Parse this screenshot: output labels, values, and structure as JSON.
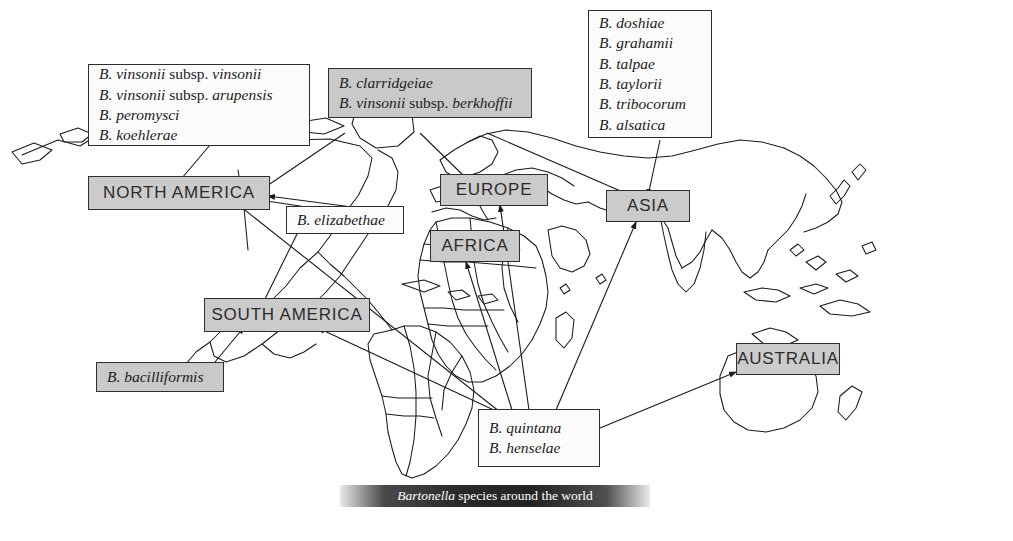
{
  "figure": {
    "caption_italic": "Bartonella",
    "caption_rest": " species around the world",
    "caption_full": "Bartonella species around the world"
  },
  "continents": [
    {
      "name": "north-america",
      "label": "NORTH AMERICA"
    },
    {
      "name": "south-america",
      "label": "SOUTH AMERICA"
    },
    {
      "name": "europe",
      "label": "EUROPE"
    },
    {
      "name": "africa",
      "label": "AFRICA"
    },
    {
      "name": "asia",
      "label": "ASIA"
    },
    {
      "name": "australia",
      "label": "AUSTRALIA"
    }
  ],
  "species_boxes": {
    "north_america": {
      "style": "plain",
      "lines": [
        {
          "genus": "B. vinsonii",
          "mid": " subsp. ",
          "epithet": "vinsonii"
        },
        {
          "genus": "B. vinsonii",
          "mid": " subsp. ",
          "epithet": "arupensis"
        },
        {
          "genus": "B. peromysci",
          "mid": "",
          "epithet": ""
        },
        {
          "genus": "B. koehlerae",
          "mid": "",
          "epithet": ""
        }
      ]
    },
    "europe_north": {
      "style": "shaded",
      "lines": [
        {
          "genus": "B. clarridgeiae",
          "mid": "",
          "epithet": ""
        },
        {
          "genus": "B. vinsonii",
          "mid": " subsp. ",
          "epithet": "berkhoffii"
        }
      ]
    },
    "asia": {
      "style": "plain",
      "lines": [
        {
          "genus": "B. doshiae",
          "mid": "",
          "epithet": ""
        },
        {
          "genus": "B. grahamii",
          "mid": "",
          "epithet": ""
        },
        {
          "genus": "B. talpae",
          "mid": "",
          "epithet": ""
        },
        {
          "genus": "B. taylorii",
          "mid": "",
          "epithet": ""
        },
        {
          "genus": "B. tribocorum",
          "mid": "",
          "epithet": ""
        },
        {
          "genus": "B. alsatica",
          "mid": "",
          "epithet": ""
        }
      ]
    },
    "elizabethae": {
      "style": "plain",
      "lines": [
        {
          "genus": "B. elizabethae",
          "mid": "",
          "epithet": ""
        }
      ]
    },
    "bacilliformis": {
      "style": "shaded",
      "lines": [
        {
          "genus": "B. bacilliformis",
          "mid": "",
          "epithet": ""
        }
      ]
    },
    "worldwide": {
      "style": "plain",
      "lines": [
        {
          "genus": "B. quintana",
          "mid": "",
          "epithet": ""
        },
        {
          "genus": "B. henselae",
          "mid": "",
          "epithet": ""
        }
      ]
    }
  },
  "colors": {
    "box_shaded_fill": "#c9c9c9",
    "continent_fill": "#cbcbcb",
    "box_border": "#2e2e2e",
    "map_outline": "#1a1a1a",
    "page_background": "#ffffff",
    "caption_text": "#ffffff"
  }
}
